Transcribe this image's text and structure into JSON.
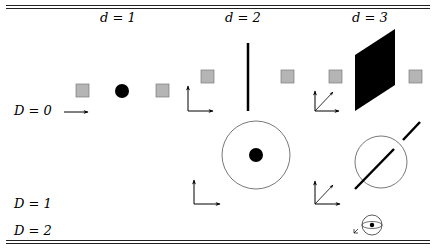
{
  "columns": [
    {
      "label": "d = 1"
    },
    {
      "label": "d = 2"
    },
    {
      "label": "d = 3"
    }
  ],
  "rows": [
    {
      "label": "D = 0"
    },
    {
      "label": "D = 1"
    },
    {
      "label": "D = 2"
    }
  ],
  "colors": {
    "square_fill": "#b5b5b5",
    "square_stroke": "#7a7a7a",
    "ink": "#000000",
    "circle_stroke": "#555555"
  },
  "icons": [
    "point-icon",
    "line-icon",
    "plane-icon",
    "circle-icon",
    "sphere-icon",
    "axes-1d-icon",
    "axes-2d-icon",
    "axes-3d-icon",
    "grey-square-icon"
  ]
}
